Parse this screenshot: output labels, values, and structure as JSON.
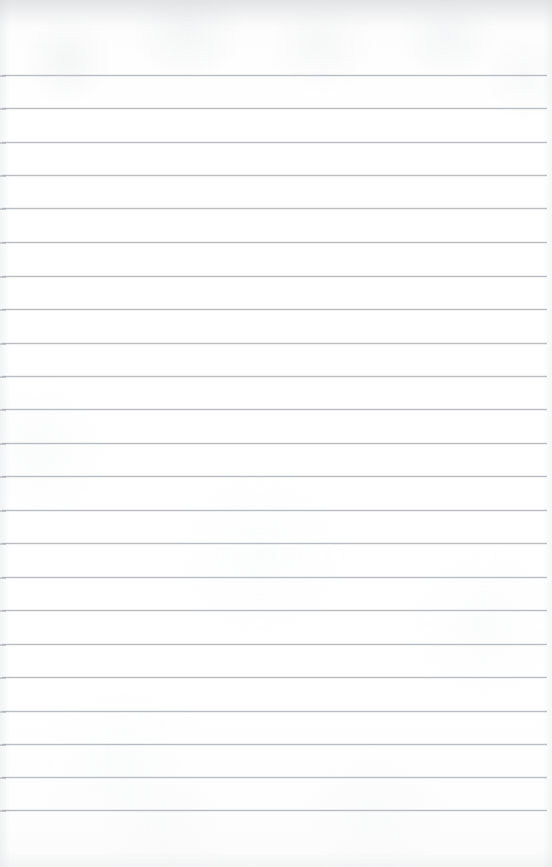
{
  "document": {
    "kind": "ruled-notebook-paper",
    "title": "Blank lined paper",
    "content_text": "",
    "width_px": 552,
    "height_px": 867
  },
  "paper": {
    "background_color": "#fdfdfd",
    "surface_tint_top": "#f2f3f4",
    "texture_note": "faint scan mottling",
    "edge_shadow_color": "#cdd0d3"
  },
  "ruling": {
    "line_color": "#b5b9bd",
    "line_thickness_px": 1,
    "line_count": 23,
    "spacing_px": 33.4,
    "first_line_y": 75,
    "last_line_y": 810,
    "line_start_x": 2,
    "line_end_x": 547,
    "header_margin_px": 74,
    "footer_margin_px": 57,
    "lines": [
      {
        "index": 1,
        "y": 75,
        "x1": 2,
        "x2": 547
      },
      {
        "index": 2,
        "y": 108,
        "x1": 2,
        "x2": 547
      },
      {
        "index": 3,
        "y": 142,
        "x1": 2,
        "x2": 547
      },
      {
        "index": 4,
        "y": 175,
        "x1": 2,
        "x2": 547
      },
      {
        "index": 5,
        "y": 208,
        "x1": 2,
        "x2": 547
      },
      {
        "index": 6,
        "y": 242,
        "x1": 2,
        "x2": 547
      },
      {
        "index": 7,
        "y": 276,
        "x1": 2,
        "x2": 547
      },
      {
        "index": 8,
        "y": 309,
        "x1": 2,
        "x2": 547
      },
      {
        "index": 9,
        "y": 343,
        "x1": 2,
        "x2": 547
      },
      {
        "index": 10,
        "y": 376,
        "x1": 2,
        "x2": 547
      },
      {
        "index": 11,
        "y": 409,
        "x1": 2,
        "x2": 547
      },
      {
        "index": 12,
        "y": 443,
        "x1": 2,
        "x2": 547
      },
      {
        "index": 13,
        "y": 476,
        "x1": 2,
        "x2": 547
      },
      {
        "index": 14,
        "y": 510,
        "x1": 2,
        "x2": 547
      },
      {
        "index": 15,
        "y": 543,
        "x1": 2,
        "x2": 547
      },
      {
        "index": 16,
        "y": 577,
        "x1": 2,
        "x2": 547
      },
      {
        "index": 17,
        "y": 610,
        "x1": 2,
        "x2": 547
      },
      {
        "index": 18,
        "y": 644,
        "x1": 2,
        "x2": 547
      },
      {
        "index": 19,
        "y": 677,
        "x1": 2,
        "x2": 547
      },
      {
        "index": 20,
        "y": 711,
        "x1": 2,
        "x2": 547
      },
      {
        "index": 21,
        "y": 744,
        "x1": 2,
        "x2": 547
      },
      {
        "index": 22,
        "y": 777,
        "x1": 2,
        "x2": 547
      },
      {
        "index": 23,
        "y": 810,
        "x1": 2,
        "x2": 547
      }
    ]
  }
}
